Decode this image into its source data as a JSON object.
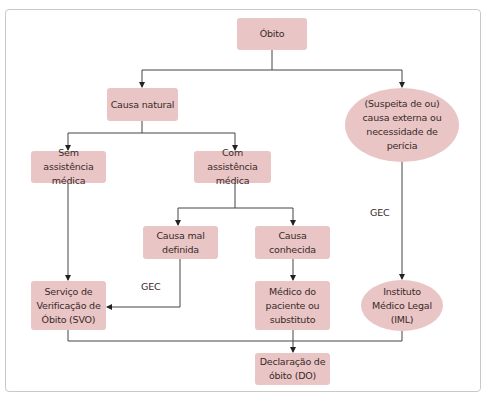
{
  "diagram": {
    "nodes": {
      "obito": "Óbito",
      "causa_natural": "Causa natural",
      "externa": "(Suspeita de ou) causa externa ou necessidade de perícia",
      "sem_assistencia": "Sem assistência médica",
      "com_assistencia": "Com assistência médica",
      "mal_definida": "Causa mal definida",
      "conhecida": "Causa conhecida",
      "svo": "Serviço de Verificação de Óbito (SVO)",
      "medico": "Médico do paciente ou substituto",
      "iml": "Instituto Médico Legal (IML)",
      "declaracao": "Declaração de óbito (DO)"
    },
    "edge_labels": {
      "gec_left": "GEC",
      "gec_right": "GEC"
    },
    "edges": [
      {
        "from": "obito",
        "to": "causa_natural"
      },
      {
        "from": "obito",
        "to": "externa"
      },
      {
        "from": "causa_natural",
        "to": "sem_assistencia"
      },
      {
        "from": "causa_natural",
        "to": "com_assistencia"
      },
      {
        "from": "com_assistencia",
        "to": "mal_definida"
      },
      {
        "from": "com_assistencia",
        "to": "conhecida"
      },
      {
        "from": "sem_assistencia",
        "to": "svo"
      },
      {
        "from": "mal_definida",
        "to": "svo",
        "label": "GEC"
      },
      {
        "from": "conhecida",
        "to": "medico"
      },
      {
        "from": "externa",
        "to": "iml",
        "label": "GEC"
      },
      {
        "from": "svo",
        "to": "declaracao"
      },
      {
        "from": "medico",
        "to": "declaracao"
      },
      {
        "from": "iml",
        "to": "declaracao"
      }
    ],
    "colors": {
      "node_fill": "#e9c5c5",
      "edge": "#333333",
      "frame": "#c9c9c9"
    }
  }
}
